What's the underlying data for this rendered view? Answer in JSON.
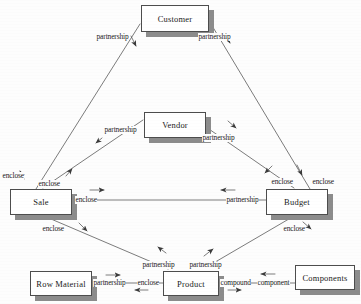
{
  "diagram": {
    "style": "scanned-er-diagram",
    "colors": {
      "box_border": "#4d4d4d",
      "box_fill": "#ffffff",
      "shadow": "#8c8c8c",
      "line": "#5a5a5a",
      "text": "#1a1a1a",
      "background": "#fdfdfd"
    },
    "entities": [
      {
        "id": "customer",
        "label": "Customer",
        "x": 141,
        "y": 5,
        "w": 68,
        "h": 27
      },
      {
        "id": "vendor",
        "label": "Vendor",
        "x": 144,
        "y": 112,
        "w": 62,
        "h": 26
      },
      {
        "id": "sale",
        "label": "Sale",
        "x": 10,
        "y": 189,
        "w": 62,
        "h": 26
      },
      {
        "id": "budget",
        "label": "Budget",
        "x": 266,
        "y": 189,
        "w": 62,
        "h": 26
      },
      {
        "id": "row_material",
        "label": "Row Material",
        "x": 30,
        "y": 271,
        "w": 62,
        "h": 25
      },
      {
        "id": "product",
        "label": "Product",
        "x": 163,
        "y": 271,
        "w": 56,
        "h": 25
      },
      {
        "id": "components",
        "label": "Components",
        "x": 295,
        "y": 265,
        "w": 60,
        "h": 25
      }
    ],
    "edge_labels": [
      {
        "id": "cust-sale-partnership",
        "text": "partnership",
        "x": 96,
        "y": 33
      },
      {
        "id": "cust-budget-partnership",
        "text": "partnership",
        "x": 198,
        "y": 33
      },
      {
        "id": "vendor-sale-partnership",
        "text": "partnership",
        "x": 104,
        "y": 126
      },
      {
        "id": "vendor-budget-partnership",
        "text": "partnership",
        "x": 202,
        "y": 134
      },
      {
        "id": "sale-enclose-outer",
        "text": "enclose",
        "x": 2,
        "y": 172
      },
      {
        "id": "sale-enclose-inner",
        "text": "enclose",
        "x": 38,
        "y": 180
      },
      {
        "id": "budget-enclose-inner",
        "text": "enclose",
        "x": 271,
        "y": 178
      },
      {
        "id": "budget-enclose-outer",
        "text": "enclose",
        "x": 312,
        "y": 178
      },
      {
        "id": "sale-product-enclose-mid",
        "text": "enclose",
        "x": 75,
        "y": 197
      },
      {
        "id": "sale-budget-partnership",
        "text": "partnership",
        "x": 226,
        "y": 197
      },
      {
        "id": "sale-enclose-lower",
        "text": "enclose",
        "x": 42,
        "y": 225
      },
      {
        "id": "budget-enclose-lower",
        "text": "enclose",
        "x": 283,
        "y": 225
      },
      {
        "id": "product-partnership-left",
        "text": "partnership",
        "x": 142,
        "y": 261
      },
      {
        "id": "product-partnership-right",
        "text": "partnership",
        "x": 189,
        "y": 261
      },
      {
        "id": "rowmat-partnership",
        "text": "partnership",
        "x": 93,
        "y": 279
      },
      {
        "id": "rowmat-enclose",
        "text": "enclose",
        "x": 137,
        "y": 279
      },
      {
        "id": "product-compound",
        "text": "compound",
        "x": 220,
        "y": 279
      },
      {
        "id": "components-component",
        "text": "component",
        "x": 257,
        "y": 279
      }
    ],
    "relationships": [
      {
        "from": "sale",
        "to": "customer",
        "label": "partnership"
      },
      {
        "from": "customer",
        "to": "budget",
        "label": "partnership"
      },
      {
        "from": "sale",
        "to": "vendor",
        "label": "partnership"
      },
      {
        "from": "vendor",
        "to": "budget",
        "label": "partnership"
      },
      {
        "from": "sale",
        "to": "budget",
        "label": "enclose / partnership"
      },
      {
        "from": "sale",
        "to": "product",
        "label": "enclose"
      },
      {
        "from": "budget",
        "to": "product",
        "label": "enclose"
      },
      {
        "from": "row_material",
        "to": "product",
        "label": "partnership / enclose"
      },
      {
        "from": "product",
        "to": "components",
        "label": "compound / component"
      }
    ]
  }
}
